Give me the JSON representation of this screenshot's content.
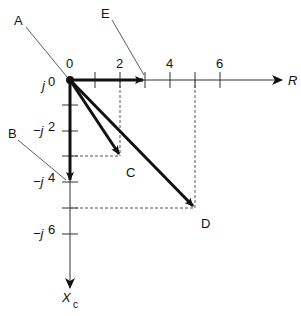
{
  "diagram": {
    "type": "phasor-impedance-diagram",
    "axes": {
      "horizontal": {
        "label": "R",
        "ticks": [
          "0",
          "2",
          "4",
          "6"
        ]
      },
      "vertical": {
        "label": "X",
        "label_subscript": "c",
        "ticks": [
          "j 0",
          "−j 2",
          "−j 4",
          "−j 6"
        ]
      }
    },
    "points": {
      "A": {
        "label": "A",
        "description": "origin"
      },
      "B": {
        "label": "B",
        "value": "0 − j4"
      },
      "C": {
        "label": "C",
        "value": "2 − j3"
      },
      "D": {
        "label": "D",
        "value": "5 − j5"
      },
      "E": {
        "label": "E",
        "value": "3 + j0"
      }
    },
    "tick_labels": {
      "r0": "0",
      "r2": "2",
      "r4": "4",
      "r6": "6",
      "x0_j": "j",
      "x0_n": "0",
      "x2_j": "−j",
      "x2_n": "2",
      "x4_j": "−j",
      "x4_n": "4",
      "x6_j": "−j",
      "x6_n": "6"
    },
    "colors": {
      "line": "#111111",
      "axis": "#333333",
      "guide": "#555555"
    }
  }
}
